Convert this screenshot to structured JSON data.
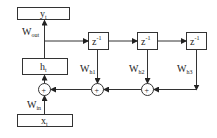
{
  "diagram": {
    "nodes": {
      "output": {
        "main": "y",
        "sub": "t"
      },
      "hidden": {
        "main": "h",
        "sub": "t"
      },
      "input": {
        "main": "x",
        "sub": "t"
      },
      "delays": [
        {
          "main": "z",
          "sup": "-1"
        },
        {
          "main": "z",
          "sup": "-1"
        },
        {
          "main": "z",
          "sup": "-1"
        }
      ],
      "adders": [
        "+",
        "+",
        "+"
      ]
    },
    "weights": {
      "out": {
        "main": "W",
        "sub": "out"
      },
      "in": {
        "main": "W",
        "sub": "in"
      },
      "h1": {
        "main": "W",
        "sub": "h1"
      },
      "h2": {
        "main": "W",
        "sub": "h2"
      },
      "h3": {
        "main": "W",
        "sub": "h3"
      }
    }
  }
}
